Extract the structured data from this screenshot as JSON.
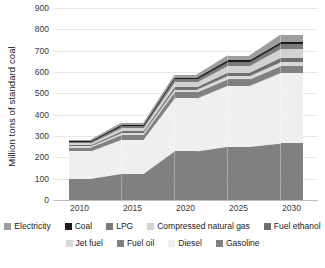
{
  "chart_data": {
    "type": "bar",
    "title": "",
    "subtitle": "",
    "xlabel": "",
    "ylabel": "Million tons of standard coal",
    "categories": [
      "2010",
      "2015",
      "2020",
      "2025",
      "2030"
    ],
    "ylim": [
      0,
      900
    ],
    "yticks": [
      0,
      100,
      200,
      300,
      400,
      500,
      600,
      700,
      800,
      900
    ],
    "ytick_labels": [
      "0",
      "100",
      "200",
      "300",
      "400",
      "500",
      "600",
      "700",
      "800",
      "900"
    ],
    "grid": true,
    "stacked": true,
    "legend_position": "bottom",
    "series": [
      {
        "name": "Gasoline",
        "color": "#808080",
        "values": [
          100,
          123,
          228,
          250,
          265
        ]
      },
      {
        "name": "Diesel",
        "color": "#efefef",
        "values": [
          128,
          160,
          248,
          285,
          330
        ]
      },
      {
        "name": "Fuel oil",
        "color": "#808080",
        "values": [
          18,
          22,
          28,
          30,
          32
        ]
      },
      {
        "name": "Jet fuel",
        "color": "#d9d9d9",
        "values": [
          6,
          9,
          13,
          16,
          19
        ]
      },
      {
        "name": "Fuel ethanol",
        "color": "#6f6f6f",
        "values": [
          5,
          8,
          12,
          16,
          20
        ]
      },
      {
        "name": "Compressed natural gas",
        "color": "#d2d2d2",
        "values": [
          8,
          14,
          22,
          31,
          42
        ]
      },
      {
        "name": "LPG",
        "color": "#7a7a7a",
        "values": [
          7,
          10,
          14,
          18,
          22
        ]
      },
      {
        "name": "Coal",
        "color": "#1a1a1a",
        "values": [
          5,
          7,
          8,
          9,
          10
        ]
      },
      {
        "name": "Electricity",
        "color": "#9e9e9e",
        "values": [
          5,
          9,
          14,
          22,
          35
        ]
      }
    ],
    "totals": [
      282,
      362,
      587,
      677,
      775
    ]
  },
  "legend": {
    "rows": [
      [
        {
          "label": "Electricity",
          "swatch": "#9e9e9e"
        },
        {
          "label": "Coal",
          "swatch": "#1a1a1a"
        },
        {
          "label": "LPG",
          "swatch": "#7a7a7a"
        },
        {
          "label": "Compressed natural gas",
          "swatch": "#d2d2d2"
        },
        {
          "label": "Fuel ethanol",
          "swatch": "#6f6f6f"
        }
      ],
      [
        {
          "label": "Jet fuel",
          "swatch": "#d9d9d9"
        },
        {
          "label": "Fuel oil",
          "swatch": "#808080"
        },
        {
          "label": "Diesel",
          "swatch": "#efefef"
        },
        {
          "label": "Gasoline",
          "swatch": "#808080"
        }
      ]
    ]
  },
  "colors": {
    "background": "#ffffff",
    "gridline": "#e8e8e8",
    "axis": "#bdbdbd",
    "text": "#1a1a1a",
    "tick_text": "#3a3a3a"
  }
}
